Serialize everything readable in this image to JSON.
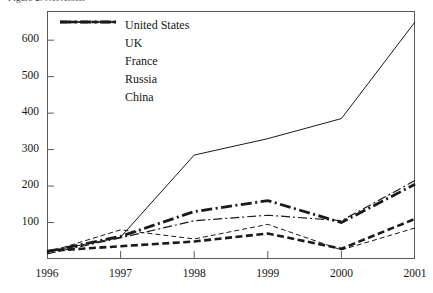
{
  "clipped_title": "Figure 2: Net Assets",
  "chart_data": {
    "type": "line",
    "title": "",
    "xlabel": "",
    "ylabel": "",
    "x": [
      "1996",
      "1997",
      "1998",
      "1999",
      "2000",
      "2001"
    ],
    "categories": [
      "1996",
      "1997",
      "1998",
      "1999",
      "2000",
      "2001"
    ],
    "ylim": [
      0,
      680
    ],
    "xlim": [
      "1996",
      "2001"
    ],
    "yticks": [
      100,
      200,
      300,
      400,
      500,
      600
    ],
    "ytick_labels": [
      "100",
      "200",
      "300",
      "400",
      "500",
      "600"
    ],
    "xtick_labels": [
      "1996",
      "1997",
      "1998",
      "1999",
      "2000",
      "2001"
    ],
    "grid": false,
    "legend_position": "top-left",
    "series": [
      {
        "name": "United States",
        "style": "thin-dashed",
        "values": [
          18,
          80,
          55,
          95,
          25,
          85
        ]
      },
      {
        "name": "UK",
        "style": "thick-dashed",
        "values": [
          22,
          35,
          48,
          70,
          28,
          110
        ]
      },
      {
        "name": "France",
        "style": "thin-solid",
        "values": [
          20,
          60,
          285,
          330,
          385,
          650
        ]
      },
      {
        "name": "Russia",
        "style": "thin-dashdot",
        "values": [
          14,
          58,
          105,
          120,
          105,
          215
        ]
      },
      {
        "name": "China",
        "style": "thick-dashdot",
        "values": [
          20,
          62,
          130,
          160,
          100,
          205
        ]
      }
    ]
  },
  "legend": {
    "items": [
      {
        "label": "United States",
        "key": "thin-dashed-key"
      },
      {
        "label": "UK",
        "key": "thick-dashed-key"
      },
      {
        "label": "France",
        "key": "thin-solid-key"
      },
      {
        "label": "Russia",
        "key": "thin-dashdot-key"
      },
      {
        "label": "China",
        "key": "thick-dashdot-key"
      }
    ]
  },
  "colors": {
    "line": "#1a1a1a",
    "axis": "#5a5a5a",
    "text": "#141414",
    "background": "#ffffff"
  }
}
